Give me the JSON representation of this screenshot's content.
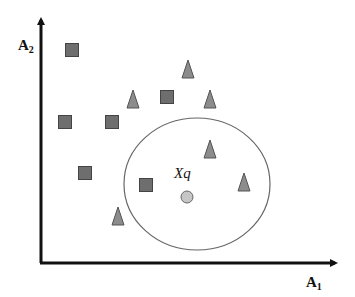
{
  "diagram": {
    "axes": {
      "x_label": "A",
      "x_subscript": "1",
      "y_label": "A",
      "y_subscript": "2"
    },
    "query_point": {
      "label": "Xq",
      "x": 187,
      "y": 197,
      "r": 6,
      "fill": "#c6c6c6"
    },
    "neighborhood": {
      "cx": 197,
      "cy": 184,
      "rx": 73,
      "ry": 66,
      "stroke": "#666666"
    },
    "square_color": "#6e6e6e",
    "triangle_color": "#8c8c8c",
    "squares": [
      {
        "x": 72,
        "y": 50
      },
      {
        "x": 65,
        "y": 122
      },
      {
        "x": 112,
        "y": 122
      },
      {
        "x": 167,
        "y": 97
      },
      {
        "x": 85,
        "y": 173
      },
      {
        "x": 146,
        "y": 185
      }
    ],
    "triangles": [
      {
        "x": 133,
        "y": 99
      },
      {
        "x": 188,
        "y": 69
      },
      {
        "x": 210,
        "y": 99
      },
      {
        "x": 210,
        "y": 149
      },
      {
        "x": 244,
        "y": 182
      },
      {
        "x": 118,
        "y": 216
      }
    ]
  }
}
